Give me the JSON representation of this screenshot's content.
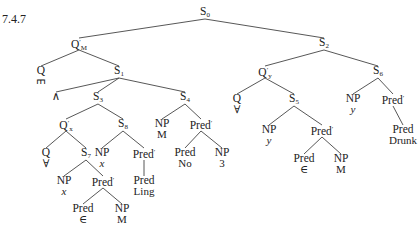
{
  "figure": {
    "label": "7.4.7",
    "line_color": "#444444",
    "nodes": [
      {
        "id": "S0",
        "cat": "S",
        "sub": "0",
        "x": 205,
        "y": 6
      },
      {
        "id": "QM",
        "cat": "Q",
        "prime": "′",
        "sub": "M",
        "x": 79,
        "y": 37
      },
      {
        "id": "S2",
        "cat": "S",
        "sub": "2",
        "x": 324,
        "y": 37
      },
      {
        "id": "Qe",
        "cat": "Q",
        "word": "∃",
        "word_rot": true,
        "x": 41,
        "y": 65
      },
      {
        "id": "S1",
        "cat": "S",
        "sub": "1",
        "x": 119,
        "y": 65
      },
      {
        "id": "and",
        "cat": "∧",
        "x": 56,
        "y": 91
      },
      {
        "id": "S3",
        "cat": "S",
        "sub": "3",
        "x": 98,
        "y": 91
      },
      {
        "id": "S4",
        "cat": "S",
        "sub": "4",
        "x": 185,
        "y": 91
      },
      {
        "id": "Qx",
        "cat": "Q",
        "prime": "′",
        "sub": "x",
        "x": 66,
        "y": 118
      },
      {
        "id": "S8",
        "cat": "S",
        "sub": "8",
        "x": 123,
        "y": 118
      },
      {
        "id": "NPM1",
        "cat": "NP",
        "word": "M",
        "x": 162,
        "y": 118
      },
      {
        "id": "Pr1",
        "cat": "Pred",
        "prime": "′",
        "x": 201,
        "y": 118
      },
      {
        "id": "Qa1",
        "cat": "Q",
        "word": "∀",
        "x": 46,
        "y": 147
      },
      {
        "id": "S7",
        "cat": "S",
        "sub": "7",
        "x": 86,
        "y": 147
      },
      {
        "id": "NPx1",
        "cat": "NP",
        "word": "x",
        "word_it": true,
        "x": 102,
        "y": 147
      },
      {
        "id": "Pr2",
        "cat": "Pred",
        "prime": "′",
        "x": 144,
        "y": 147
      },
      {
        "id": "PredNo",
        "cat": "Pred",
        "word": "No",
        "x": 185,
        "y": 147
      },
      {
        "id": "NP3",
        "cat": "NP",
        "word": "3",
        "x": 222,
        "y": 147
      },
      {
        "id": "NPx2",
        "cat": "NP",
        "word": "x",
        "word_it": true,
        "x": 64,
        "y": 175
      },
      {
        "id": "Pr3",
        "cat": "Pred",
        "prime": "′",
        "x": 103,
        "y": 175
      },
      {
        "id": "PredLing",
        "cat": "Pred",
        "word": "Ling",
        "x": 144,
        "y": 175
      },
      {
        "id": "PredIn1",
        "cat": "Pred",
        "word": "∈",
        "x": 83,
        "y": 203
      },
      {
        "id": "NPM2",
        "cat": "NP",
        "word": "M",
        "x": 122,
        "y": 203
      },
      {
        "id": "Qy",
        "cat": "Q",
        "prime": "′",
        "sub": "y",
        "x": 265,
        "y": 65
      },
      {
        "id": "S6",
        "cat": "S",
        "sub": "6",
        "x": 378,
        "y": 65
      },
      {
        "id": "Qa2",
        "cat": "Q",
        "word": "∀",
        "x": 237,
        "y": 93
      },
      {
        "id": "S5",
        "cat": "S",
        "sub": "5",
        "x": 294,
        "y": 93
      },
      {
        "id": "NPy1",
        "cat": "NP",
        "word": "y",
        "word_it": true,
        "x": 353,
        "y": 93
      },
      {
        "id": "Pr4",
        "cat": "Pred",
        "prime": "′",
        "x": 393,
        "y": 93
      },
      {
        "id": "NPy2",
        "cat": "NP",
        "word": "y",
        "word_it": true,
        "x": 269,
        "y": 124
      },
      {
        "id": "Pr5",
        "cat": "Pred",
        "prime": "′",
        "x": 322,
        "y": 124
      },
      {
        "id": "PredDrunk",
        "cat": "Pred",
        "word": "Drunk",
        "x": 403,
        "y": 124
      },
      {
        "id": "PredIn2",
        "cat": "Pred",
        "word": "∈",
        "x": 304,
        "y": 153
      },
      {
        "id": "NPM3",
        "cat": "NP",
        "word": "M",
        "x": 341,
        "y": 153
      }
    ],
    "edges": [
      [
        "S0",
        "QM"
      ],
      [
        "S0",
        "S2"
      ],
      [
        "QM",
        "Qe"
      ],
      [
        "QM",
        "S1"
      ],
      [
        "S1",
        "and"
      ],
      [
        "S1",
        "S3"
      ],
      [
        "S1",
        "S4"
      ],
      [
        "S3",
        "Qx"
      ],
      [
        "S3",
        "S8"
      ],
      [
        "S4",
        "NPM1"
      ],
      [
        "S4",
        "Pr1"
      ],
      [
        "Qx",
        "Qa1"
      ],
      [
        "Qx",
        "S7"
      ],
      [
        "S8",
        "NPx1"
      ],
      [
        "S8",
        "Pr2"
      ],
      [
        "Pr1",
        "PredNo"
      ],
      [
        "Pr1",
        "NP3"
      ],
      [
        "S7",
        "NPx2"
      ],
      [
        "S7",
        "Pr3"
      ],
      [
        "Pr2",
        "PredLing"
      ],
      [
        "Pr3",
        "PredIn1"
      ],
      [
        "Pr3",
        "NPM2"
      ],
      [
        "S2",
        "Qy"
      ],
      [
        "S2",
        "S6"
      ],
      [
        "Qy",
        "Qa2"
      ],
      [
        "Qy",
        "S5"
      ],
      [
        "S6",
        "NPy1"
      ],
      [
        "S6",
        "Pr4"
      ],
      [
        "S5",
        "NPy2"
      ],
      [
        "S5",
        "Pr5"
      ],
      [
        "Pr4",
        "PredDrunk"
      ],
      [
        "Pr5",
        "PredIn2"
      ],
      [
        "Pr5",
        "NPM3"
      ]
    ]
  }
}
